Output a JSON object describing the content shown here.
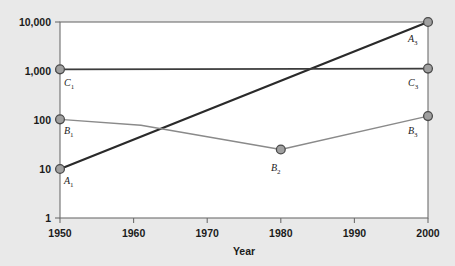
{
  "chart_data": {
    "type": "line",
    "title": "",
    "xlabel": "Year",
    "ylabel": "",
    "yscale": "log",
    "xlim": [
      1950,
      2000
    ],
    "ylim": [
      1,
      10000
    ],
    "grid": false,
    "legend_position": "none",
    "x_ticks": [
      "1950",
      "1960",
      "1970",
      "1980",
      "1990",
      "2000"
    ],
    "x_tick_values": [
      1950,
      1960,
      1970,
      1980,
      1990,
      2000
    ],
    "y_ticks": [
      "1",
      "10",
      "100",
      "1,000",
      "10,000"
    ],
    "y_tick_values": [
      1,
      10,
      100,
      1000,
      10000
    ],
    "series": [
      {
        "name": "A",
        "color": "#2a2a2a",
        "width": 2.2,
        "x": [
          1950,
          2000
        ],
        "values": [
          10,
          10000
        ],
        "points": [
          {
            "label": "A",
            "sub": "1",
            "x": 1950,
            "y": 10
          },
          {
            "label": "A",
            "sub": "3",
            "x": 2000,
            "y": 10000
          }
        ]
      },
      {
        "name": "B",
        "color": "#8a8a8a",
        "width": 1.4,
        "x": [
          1950,
          1961,
          1980,
          2000
        ],
        "values": [
          103,
          78,
          25,
          120
        ],
        "points": [
          {
            "label": "B",
            "sub": "1",
            "x": 1950,
            "y": 103
          },
          {
            "label": "B",
            "sub": "2",
            "x": 1980,
            "y": 25
          },
          {
            "label": "B",
            "sub": "3",
            "x": 2000,
            "y": 120
          }
        ]
      },
      {
        "name": "C",
        "color": "#3c3c3c",
        "width": 1.8,
        "x": [
          1950,
          2000
        ],
        "values": [
          1080,
          1120
        ],
        "points": [
          {
            "label": "C",
            "sub": "1",
            "x": 1950,
            "y": 1080
          },
          {
            "label": "C",
            "sub": "3",
            "x": 2000,
            "y": 1120
          }
        ]
      }
    ],
    "marker": {
      "fill": "#a0a0a0",
      "stroke": "#4a4a4a",
      "radius": 4.4
    },
    "plot_area": {
      "left": 60,
      "top": 22,
      "right": 428,
      "bottom": 218
    },
    "frame_color": "#6e6e6e",
    "background": "#e9e9e9",
    "plot_background": "#ffffff"
  },
  "labels": {
    "y_10000": "10,000",
    "y_1000": "1,000",
    "y_100": "100",
    "y_10": "10",
    "y_1": "1",
    "x_1950": "1950",
    "x_1960": "1960",
    "x_1970": "1970",
    "x_1980": "1980",
    "x_1990": "1990",
    "x_2000": "2000",
    "axis_title_x": "Year",
    "a1": "A",
    "a1_sub": "1",
    "a3": "A",
    "a3_sub": "3",
    "b1": "B",
    "b1_sub": "1",
    "b2": "B",
    "b2_sub": "2",
    "b3": "B",
    "b3_sub": "3",
    "c1": "C",
    "c1_sub": "1",
    "c3": "C",
    "c3_sub": "3"
  }
}
